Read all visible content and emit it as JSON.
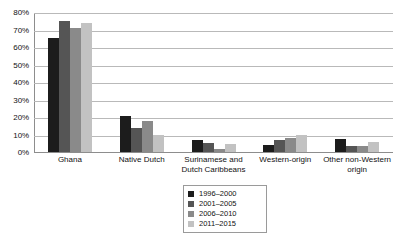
{
  "chart_data": {
    "type": "bar",
    "title": "",
    "subtitle": "",
    "xlabel": "",
    "ylabel": "",
    "ylim": [
      0,
      80
    ],
    "ytick_labels": [
      "80%",
      "70%",
      "60%",
      "50%",
      "40%",
      "30%",
      "20%",
      "10%",
      "0%"
    ],
    "ytick_values": [
      80,
      70,
      60,
      50,
      40,
      30,
      20,
      10,
      0
    ],
    "grid": true,
    "legend_position": "bottom-center",
    "value_unit": "percent",
    "categories": [
      "Ghana",
      "Native Dutch",
      "Surinamese and Dutch Caribbeans",
      "Western-origin",
      "Other non-Western origin"
    ],
    "category_label_lines": [
      [
        "Ghana"
      ],
      [
        "Native Dutch"
      ],
      [
        "Surinamese and",
        "Dutch Caribbeans"
      ],
      [
        "Western-origin"
      ],
      [
        "Other non-Western",
        "origin"
      ]
    ],
    "series": [
      {
        "name": "1996–2000",
        "color": "#1c1c1c",
        "values": [
          65,
          20.5,
          7,
          4,
          7.5
        ]
      },
      {
        "name": "2001–2005",
        "color": "#555555",
        "values": [
          75,
          13.5,
          5,
          7,
          3.5
        ]
      },
      {
        "name": "2006–2010",
        "color": "#8a8a8a",
        "values": [
          71,
          17.5,
          2,
          8,
          3.5
        ]
      },
      {
        "name": "2011–2015",
        "color": "#c2c2c2",
        "values": [
          74,
          10,
          4.5,
          9.5,
          6
        ]
      }
    ]
  },
  "colors": {
    "gridline": "#b9b9b9",
    "axis": "#8d8d8d",
    "text": "#111111",
    "background": "#ffffff",
    "legend_border": "#9a9a9a"
  }
}
